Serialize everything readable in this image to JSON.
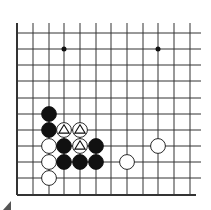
{
  "board": {
    "description": "Go problem diagram, partial board (lower-left region)",
    "colors": {
      "line": "#333333",
      "black": "#111111",
      "white": "#ffffff",
      "background": "#ffffff"
    },
    "grid": {
      "x": [
        17,
        33,
        49,
        64,
        80,
        96,
        111,
        127,
        143,
        158,
        174,
        190
      ],
      "y": [
        33,
        49,
        65,
        81,
        98,
        114,
        130,
        146,
        162,
        178,
        195
      ],
      "line_top": 23,
      "line_right": 201,
      "left_edge": true,
      "bottom_edge": true
    },
    "star_points": [
      {
        "col": 3,
        "row": 1
      },
      {
        "col": 9,
        "row": 1
      }
    ],
    "stones": [
      {
        "color": "black",
        "col": 2,
        "row": 5,
        "mark": ""
      },
      {
        "color": "black",
        "col": 2,
        "row": 6,
        "mark": ""
      },
      {
        "color": "white",
        "col": 3,
        "row": 6,
        "mark": "triangle"
      },
      {
        "color": "white",
        "col": 4,
        "row": 6,
        "mark": "triangle"
      },
      {
        "color": "white",
        "col": 2,
        "row": 7,
        "mark": ""
      },
      {
        "color": "black",
        "col": 3,
        "row": 7,
        "mark": ""
      },
      {
        "color": "white",
        "col": 4,
        "row": 7,
        "mark": "triangle"
      },
      {
        "color": "black",
        "col": 5,
        "row": 7,
        "mark": ""
      },
      {
        "color": "white",
        "col": 9,
        "row": 7,
        "mark": ""
      },
      {
        "color": "white",
        "col": 2,
        "row": 8,
        "mark": ""
      },
      {
        "color": "black",
        "col": 3,
        "row": 8,
        "mark": ""
      },
      {
        "color": "black",
        "col": 4,
        "row": 8,
        "mark": ""
      },
      {
        "color": "black",
        "col": 5,
        "row": 8,
        "mark": ""
      },
      {
        "color": "white",
        "col": 7,
        "row": 8,
        "mark": ""
      },
      {
        "color": "white",
        "col": 2,
        "row": 9,
        "mark": ""
      }
    ],
    "corner_mark": "triangle-artifact"
  }
}
